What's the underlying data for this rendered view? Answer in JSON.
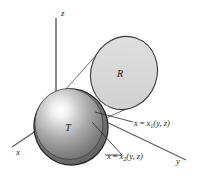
{
  "figure": {
    "background_color": "#ffffff",
    "width": 198,
    "height": 179
  },
  "axes": [
    {
      "id": "z",
      "label": "z",
      "name": "z-axis",
      "direction": "up"
    },
    {
      "id": "x",
      "label": "x",
      "name": "x-axis",
      "direction": "down-left"
    },
    {
      "id": "y",
      "label": "y",
      "name": "y-axis",
      "direction": "down-right"
    }
  ],
  "shapes": {
    "solid": {
      "label": "T",
      "name": "solid-region-T",
      "fill_light": "#fbfbfb",
      "fill_mid": "#9a9a9a",
      "fill_dark": "#5f5f5f",
      "stroke": "#2b2b2b"
    },
    "region": {
      "label": "R",
      "name": "projection-region-R",
      "fill": "#d8d8d8",
      "stroke": "#3a3a3a"
    }
  },
  "callouts": [
    {
      "id": "x1",
      "name": "surface-label-x1",
      "text": "x = x1(y, z)",
      "lhs": "x",
      "eq": "=",
      "fn": "x",
      "sub": "1",
      "args": "(y, z)"
    },
    {
      "id": "x2",
      "name": "surface-label-x2",
      "text": "x = x2(y, z)",
      "lhs": "x",
      "eq": "=",
      "fn": "x",
      "sub": "2",
      "args": "(y, z)"
    }
  ],
  "colors": {
    "line": "#555555",
    "text": "#1a1a1a",
    "leader": "#2b2b2b"
  }
}
